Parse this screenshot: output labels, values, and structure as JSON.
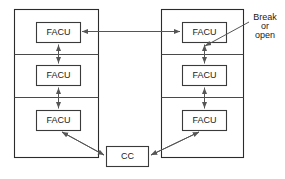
{
  "diagram": {
    "background_color": "#ffffff",
    "line_color": "#555555",
    "border_color": "#2b2b2b",
    "text_color": "#1a1a1a",
    "panels": [
      {
        "id": "left-panel",
        "name": "left-panel",
        "x": 14,
        "y": 9,
        "width": 84,
        "height": 149,
        "dividers": [
          54,
          97
        ],
        "nodes": [
          {
            "id": "left-facu-1",
            "label": "FACU",
            "x": 36,
            "y": 22,
            "width": 44,
            "height": 20
          },
          {
            "id": "left-facu-2",
            "label": "FACU",
            "x": 36,
            "y": 65,
            "width": 44,
            "height": 20
          },
          {
            "id": "left-facu-3",
            "label": "FACU",
            "x": 36,
            "y": 110,
            "width": 44,
            "height": 20
          }
        ]
      },
      {
        "id": "right-panel",
        "name": "right-panel",
        "x": 161,
        "y": 9,
        "width": 82,
        "height": 149,
        "dividers": [
          54,
          97
        ],
        "nodes": [
          {
            "id": "right-facu-1",
            "label": "FACU",
            "x": 182,
            "y": 22,
            "width": 44,
            "height": 20
          },
          {
            "id": "right-facu-2",
            "label": "FACU",
            "x": 182,
            "y": 65,
            "width": 44,
            "height": 20
          },
          {
            "id": "right-facu-3",
            "label": "FACU",
            "x": 182,
            "y": 110,
            "width": 44,
            "height": 20
          }
        ]
      }
    ],
    "central_node": {
      "id": "cc",
      "label": "CC",
      "x": 106,
      "y": 146,
      "width": 42,
      "height": 20
    },
    "annotation": {
      "id": "break-or-open",
      "lines": [
        "Break",
        "or",
        "open"
      ],
      "text_x": 265,
      "line_y": [
        18,
        27,
        36
      ],
      "leader_from_x": 248,
      "leader_from_y": 22,
      "leader_to_x": 203,
      "leader_to_y": 47
    },
    "connections": [
      {
        "id": "left-v1",
        "from": "left-facu-1",
        "to": "left-facu-2",
        "style": "double-arrow",
        "orientation": "vertical"
      },
      {
        "id": "left-v2",
        "from": "left-facu-2",
        "to": "left-facu-3",
        "style": "double-arrow",
        "orientation": "vertical"
      },
      {
        "id": "right-v1",
        "from": "right-facu-1",
        "to": "right-facu-2",
        "style": "double-arrow",
        "orientation": "vertical"
      },
      {
        "id": "right-v2",
        "from": "right-facu-2",
        "to": "right-facu-3",
        "style": "double-arrow",
        "orientation": "vertical"
      },
      {
        "id": "cross-link",
        "from": "left-facu-1",
        "to": "right-facu-1",
        "style": "double-arrow",
        "orientation": "horizontal"
      },
      {
        "id": "left-cc-link",
        "from": "left-facu-3",
        "to": "cc",
        "style": "double-arrow",
        "orientation": "diagonal"
      },
      {
        "id": "right-cc-link",
        "from": "right-facu-3",
        "to": "cc",
        "style": "double-arrow",
        "orientation": "diagonal"
      }
    ]
  }
}
